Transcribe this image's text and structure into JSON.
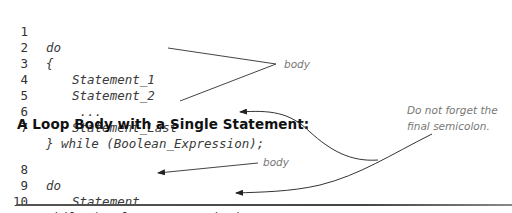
{
  "code_block_1": {
    "lines": [
      {
        "number": "1",
        "text": "do",
        "indent": 0
      },
      {
        "number": "2",
        "text": "{",
        "indent": 0
      },
      {
        "number": "3",
        "text": "Statement_1",
        "indent": 1
      },
      {
        "number": "4",
        "text": "Statement_2",
        "indent": 1
      },
      {
        "number": "5",
        "text": " ...",
        "indent": 1
      },
      {
        "number": "6",
        "text": "Statement_Last",
        "indent": 1
      },
      {
        "number": "7",
        "text": "} while (Boolean_Expression);",
        "indent": 0
      }
    ]
  },
  "heading": "A Loop Body with a Single Statement:",
  "code_block_2": {
    "lines": [
      {
        "number": "8",
        "text": "do",
        "indent": 0
      },
      {
        "number": "9",
        "text": "Statement",
        "indent": 1
      },
      {
        "number": "10",
        "text": "while (Boolean_Expression);",
        "indent": 0
      }
    ]
  },
  "annotations": {
    "body_1": "body",
    "body_2": "body",
    "semicolon_note_line1": "Do not forget the",
    "semicolon_note_line2": "final semicolon."
  },
  "colors": {
    "code_text": "#3a3a3a",
    "annotation_text": "#777777",
    "arrow": "#333333",
    "rule": "#555555"
  }
}
